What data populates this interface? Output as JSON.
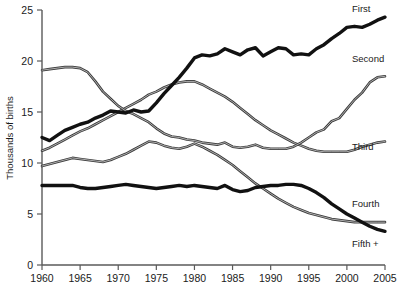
{
  "chart_data": {
    "type": "line",
    "title": "",
    "xlabel": "",
    "ylabel": "Thousands of births",
    "xlim": [
      1960,
      2005
    ],
    "ylim": [
      0,
      25
    ],
    "grid": false,
    "legend_position": "right-inline",
    "x_ticks": [
      "1960",
      "1965",
      "1970",
      "1975",
      "1980",
      "1985",
      "1990",
      "1995",
      "2000",
      "2005"
    ],
    "y_ticks": [
      "0",
      "5",
      "10",
      "15",
      "20",
      "25"
    ],
    "x": [
      1960,
      1961,
      1962,
      1963,
      1964,
      1965,
      1966,
      1967,
      1968,
      1969,
      1970,
      1971,
      1972,
      1973,
      1974,
      1975,
      1976,
      1977,
      1978,
      1979,
      1980,
      1981,
      1982,
      1983,
      1984,
      1985,
      1986,
      1987,
      1988,
      1989,
      1990,
      1991,
      1992,
      1993,
      1994,
      1995,
      1996,
      1997,
      1998,
      1999,
      2000,
      2001,
      2002,
      2003,
      2004,
      2005
    ],
    "series": [
      {
        "name": "First",
        "label": "First",
        "style": "thick",
        "values": [
          12.5,
          12.2,
          12.7,
          13.2,
          13.5,
          13.8,
          14.0,
          14.4,
          14.7,
          15.1,
          15.0,
          14.9,
          15.2,
          15.0,
          15.1,
          15.9,
          16.8,
          17.6,
          18.4,
          19.3,
          20.3,
          20.6,
          20.5,
          20.7,
          21.2,
          20.9,
          20.6,
          21.1,
          21.3,
          20.5,
          20.9,
          21.3,
          21.2,
          20.6,
          20.7,
          20.6,
          21.2,
          21.6,
          22.2,
          22.7,
          23.3,
          23.4,
          23.3,
          23.6,
          24.0,
          24.3
        ]
      },
      {
        "name": "Second",
        "label": "Second",
        "style": "thin",
        "values": [
          19.1,
          19.2,
          19.3,
          19.4,
          19.4,
          19.3,
          18.9,
          18.0,
          17.0,
          16.3,
          15.6,
          15.1,
          14.8,
          14.4,
          14.0,
          13.4,
          12.9,
          12.6,
          12.5,
          12.3,
          12.2,
          12.0,
          11.9,
          11.8,
          12.0,
          11.6,
          11.5,
          11.6,
          11.8,
          11.5,
          11.4,
          11.4,
          11.4,
          11.6,
          12.0,
          12.5,
          13.0,
          13.3,
          14.1,
          14.4,
          15.3,
          16.2,
          16.9,
          17.9,
          18.4,
          18.5
        ]
      },
      {
        "name": "Third",
        "label": "Third",
        "style": "thin",
        "values": [
          11.2,
          11.5,
          11.9,
          12.3,
          12.7,
          13.1,
          13.4,
          13.8,
          14.2,
          14.6,
          15.0,
          15.4,
          15.8,
          16.2,
          16.7,
          17.0,
          17.4,
          17.7,
          17.9,
          18.0,
          18.0,
          17.7,
          17.3,
          16.9,
          16.5,
          16.0,
          15.4,
          14.8,
          14.2,
          13.7,
          13.2,
          12.8,
          12.4,
          12.0,
          11.7,
          11.4,
          11.2,
          11.1,
          11.1,
          11.1,
          11.1,
          11.3,
          11.6,
          11.8,
          12.0,
          12.1
        ]
      },
      {
        "name": "Fourth",
        "label": "Fourth",
        "style": "thin",
        "values": [
          9.7,
          9.9,
          10.1,
          10.3,
          10.5,
          10.4,
          10.3,
          10.2,
          10.1,
          10.3,
          10.6,
          10.9,
          11.3,
          11.7,
          12.1,
          12.0,
          11.7,
          11.5,
          11.4,
          11.6,
          11.9,
          11.6,
          11.2,
          10.8,
          10.3,
          9.8,
          9.2,
          8.6,
          8.0,
          7.5,
          7.0,
          6.5,
          6.1,
          5.7,
          5.4,
          5.1,
          4.9,
          4.7,
          4.5,
          4.4,
          4.3,
          4.2,
          4.2,
          4.2,
          4.2,
          4.2
        ]
      },
      {
        "name": "Fifth +",
        "label": "Fifth +",
        "style": "thick",
        "values": [
          7.8,
          7.8,
          7.8,
          7.8,
          7.8,
          7.6,
          7.5,
          7.5,
          7.6,
          7.7,
          7.8,
          7.9,
          7.8,
          7.7,
          7.6,
          7.5,
          7.6,
          7.7,
          7.8,
          7.7,
          7.8,
          7.7,
          7.6,
          7.5,
          7.8,
          7.4,
          7.2,
          7.3,
          7.6,
          7.7,
          7.8,
          7.8,
          7.9,
          7.9,
          7.8,
          7.5,
          7.1,
          6.6,
          6.0,
          5.5,
          5.0,
          4.6,
          4.2,
          3.8,
          3.5,
          3.3
        ]
      }
    ],
    "series_render_order": [
      "Third",
      "Fourth",
      "Second",
      "Fifth +",
      "First"
    ],
    "colors": {
      "thick_line": "#111111",
      "thin_line": "#3b3b3b",
      "axis": "#5a5a5a",
      "text": "#1a1a1a",
      "background": "#ffffff"
    },
    "label_positions": {
      "First": {
        "x": 352,
        "y": 12
      },
      "Second": {
        "x": 352,
        "y": 62
      },
      "Third": {
        "x": 352,
        "y": 150
      },
      "Fourth": {
        "x": 352,
        "y": 207
      },
      "Fifth +": {
        "x": 352,
        "y": 247
      }
    }
  },
  "plot_geometry": {
    "left": 42,
    "right": 385,
    "top": 10,
    "bottom": 265
  }
}
